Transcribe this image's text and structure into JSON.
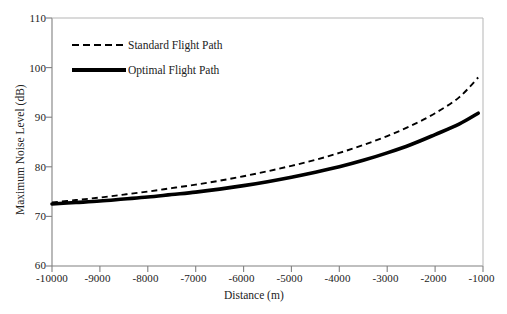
{
  "chart_data": {
    "type": "line",
    "title": "",
    "xlabel": "Distance (m)",
    "ylabel": "Maximum Noise Level (dB)",
    "xlim": [
      -10000,
      -1000
    ],
    "ylim": [
      60,
      110
    ],
    "xticks": [
      -10000,
      -9000,
      -8000,
      -7000,
      -6000,
      -5000,
      -4000,
      -3000,
      -2000,
      -1000
    ],
    "yticks": [
      60,
      70,
      80,
      90,
      100,
      110
    ],
    "xtick_labels": [
      "-10000",
      "-9000",
      "-8000",
      "-7000",
      "-6000",
      "-5000",
      "-4000",
      "-3000",
      "-2000",
      "-1000"
    ],
    "ytick_labels": [
      "60",
      "70",
      "80",
      "90",
      "100",
      "110"
    ],
    "grid": false,
    "legend_position": "upper-left-inside",
    "x": [
      -10000,
      -9500,
      -9000,
      -8500,
      -8000,
      -7500,
      -7000,
      -6500,
      -6000,
      -5500,
      -5000,
      -4500,
      -4000,
      -3500,
      -3000,
      -2500,
      -2000,
      -1500,
      -1100
    ],
    "series": [
      {
        "name": "Standard Flight Path",
        "style": "dashed",
        "color": "#000000",
        "width": 1.9,
        "values": [
          72.8,
          73.3,
          73.8,
          74.4,
          75.0,
          75.7,
          76.4,
          77.2,
          78.1,
          79.1,
          80.2,
          81.4,
          82.8,
          84.4,
          86.2,
          88.3,
          90.8,
          94.0,
          98.0
        ]
      },
      {
        "name": "Optimal Flight Path",
        "style": "solid",
        "color": "#000000",
        "width": 3.6,
        "values": [
          72.5,
          72.8,
          73.1,
          73.5,
          73.9,
          74.4,
          74.9,
          75.5,
          76.2,
          77.0,
          77.9,
          78.9,
          80.0,
          81.3,
          82.8,
          84.5,
          86.5,
          88.6,
          90.8
        ]
      }
    ]
  },
  "legend": {
    "items": [
      {
        "label": "Standard Flight Path",
        "style": "dashed"
      },
      {
        "label": "Optimal Flight Path",
        "style": "solid"
      }
    ]
  }
}
